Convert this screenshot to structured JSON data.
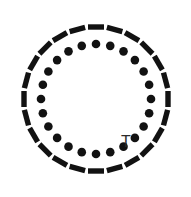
{
  "figure": {
    "background_color": "#ffffff",
    "ink_color": "#121212",
    "width": 191,
    "height": 197
  },
  "dial": {
    "center_x": 96,
    "center_y": 99,
    "tick_count": 24,
    "tick_step_degrees": 15,
    "start_angle_degrees": -90,
    "tick_radius": 72,
    "tick_length": 16,
    "tick_thickness": 5.4,
    "tick_color": "#121212",
    "dot_count": 24,
    "dot_radius_from_center": 55,
    "dot_size": 4.3,
    "dot_color": "#121212"
  },
  "label": {
    "text": "T",
    "x": 126,
    "y": 147,
    "font_size": 16,
    "color": "#2b2b2b"
  },
  "chart_data": {
    "type": "scatter",
    "xlabel": "",
    "ylabel": "",
    "grid": false,
    "legend": "none",
    "annotations": [
      "T"
    ],
    "series": [
      {
        "name": "outer-ticks",
        "marker": "radial-dash",
        "radius": 72,
        "angles_degrees": [
          -90,
          -75,
          -60,
          -45,
          -30,
          -15,
          0,
          15,
          30,
          45,
          60,
          75,
          90,
          105,
          120,
          135,
          150,
          165,
          180,
          195,
          210,
          225,
          240,
          255
        ],
        "values": [
          1,
          1,
          1,
          1,
          1,
          1,
          1,
          1,
          1,
          1,
          1,
          1,
          1,
          1,
          1,
          1,
          1,
          1,
          1,
          1,
          1,
          1,
          1,
          1
        ]
      },
      {
        "name": "inner-dots",
        "marker": "dot",
        "radius": 55,
        "angles_degrees": [
          -90,
          -75,
          -60,
          -45,
          -30,
          -15,
          0,
          15,
          30,
          45,
          60,
          75,
          90,
          105,
          120,
          135,
          150,
          165,
          180,
          195,
          210,
          225,
          240,
          255
        ],
        "values": [
          1,
          1,
          1,
          1,
          1,
          1,
          1,
          1,
          1,
          1,
          1,
          1,
          1,
          1,
          1,
          1,
          1,
          1,
          1,
          1,
          1,
          1,
          1,
          1
        ]
      }
    ]
  }
}
